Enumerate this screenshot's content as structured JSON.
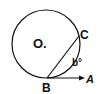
{
  "diagram": {
    "type": "circle-tangent-chord",
    "labels": {
      "center": "O.",
      "point_c": "C",
      "point_b": "B",
      "point_a": "A",
      "angle": "b°"
    },
    "colors": {
      "stroke": "#111111",
      "background": "#ffffff"
    }
  }
}
